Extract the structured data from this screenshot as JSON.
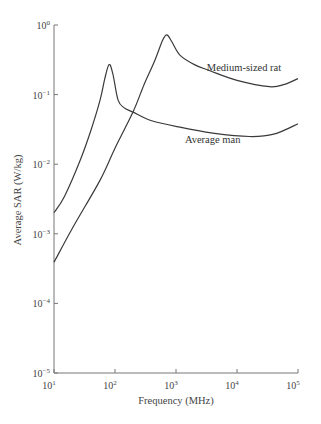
{
  "chart_data": {
    "type": "line",
    "title": "",
    "xlabel": "Frequency (MHz)",
    "ylabel": "Average SAR (W/kg)",
    "xscale": "log",
    "yscale": "log",
    "xlim": [
      10,
      100000
    ],
    "ylim": [
      1e-05,
      1
    ],
    "grid": false,
    "x_ticks": [
      {
        "base": "10",
        "exp": "1",
        "value": 10
      },
      {
        "base": "10",
        "exp": "2",
        "value": 100
      },
      {
        "base": "10",
        "exp": "3",
        "value": 1000
      },
      {
        "base": "10",
        "exp": "4",
        "value": 10000
      },
      {
        "base": "10",
        "exp": "5",
        "value": 100000
      }
    ],
    "y_ticks": [
      {
        "base": "10",
        "exp": "0",
        "value": 1
      },
      {
        "base": "10",
        "exp": "−1",
        "value": 0.1
      },
      {
        "base": "10",
        "exp": "−2",
        "value": 0.01
      },
      {
        "base": "10",
        "exp": "−3",
        "value": 0.001
      },
      {
        "base": "10",
        "exp": "−4",
        "value": 0.0001
      },
      {
        "base": "10",
        "exp": "−5",
        "value": 1e-05
      }
    ],
    "series": [
      {
        "name": "Average man",
        "label_pos": {
          "freq": 1400,
          "sar": 0.02
        },
        "points": [
          [
            10,
            0.002
          ],
          [
            15,
            0.0035
          ],
          [
            27,
            0.0115
          ],
          [
            40,
            0.03
          ],
          [
            57,
            0.084
          ],
          [
            68,
            0.17
          ],
          [
            80,
            0.27
          ],
          [
            92,
            0.2
          ],
          [
            112,
            0.084
          ],
          [
            140,
            0.065
          ],
          [
            197,
            0.056
          ],
          [
            400,
            0.042
          ],
          [
            1160,
            0.034
          ],
          [
            4000,
            0.028
          ],
          [
            16000,
            0.025
          ],
          [
            40000,
            0.027
          ],
          [
            100000,
            0.038
          ]
        ]
      },
      {
        "name": "Medium-sized rat",
        "label_pos": {
          "freq": 3200,
          "sar": 0.22
        },
        "points": [
          [
            10,
            0.00039
          ],
          [
            20,
            0.0012
          ],
          [
            57,
            0.0059
          ],
          [
            100,
            0.017
          ],
          [
            197,
            0.056
          ],
          [
            300,
            0.14
          ],
          [
            450,
            0.31
          ],
          [
            600,
            0.6
          ],
          [
            710,
            0.72
          ],
          [
            850,
            0.58
          ],
          [
            1160,
            0.37
          ],
          [
            2000,
            0.27
          ],
          [
            3600,
            0.22
          ],
          [
            10000,
            0.16
          ],
          [
            34000,
            0.13
          ],
          [
            60000,
            0.14
          ],
          [
            100000,
            0.17
          ]
        ]
      }
    ]
  }
}
